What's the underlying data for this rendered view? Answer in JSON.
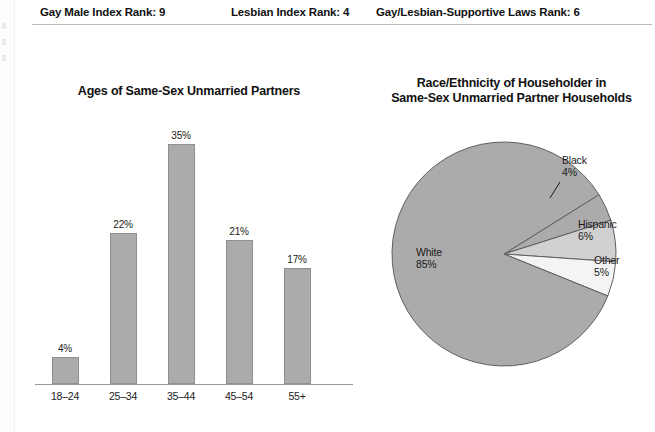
{
  "page": {
    "background_color": "#ffffff",
    "bleed_digits": [
      "4",
      "3",
      "3"
    ]
  },
  "header": {
    "ranks": [
      {
        "label": "Gay Male Index Rank: 9"
      },
      {
        "label": "Lesbian Index Rank: 4"
      },
      {
        "label": "Gay/Lesbian-Supportive Laws Rank: 6"
      }
    ]
  },
  "bar_panel": {
    "title": "Ages of Same-Sex Unmarried Partners"
  },
  "pie_panel": {
    "title_line1": "Race/Ethnicity of Householder in",
    "title_line2": "Same-Sex Unmarried Partner Households"
  },
  "chart_data": [
    {
      "type": "bar",
      "title": "Ages of Same-Sex Unmarried Partners",
      "xlabel": "",
      "ylabel": "",
      "ylim": [
        0,
        40
      ],
      "grid": false,
      "legend": "none",
      "categories": [
        "18–24",
        "25–34",
        "35–44",
        "45–54",
        "55+"
      ],
      "values": [
        4,
        22,
        35,
        21,
        17
      ],
      "value_labels": [
        "4%",
        "22%",
        "35%",
        "21%",
        "17%"
      ],
      "bar_color": "#ababab",
      "bar_edge_color": "#8f8f8f"
    },
    {
      "type": "pie",
      "title": "Race/Ethnicity of Householder in Same-Sex Unmarried Partner Households",
      "legend": "labels-on-slices",
      "labels": [
        "White",
        "Black",
        "Hispanic",
        "Other"
      ],
      "values": [
        85,
        4,
        6,
        5
      ],
      "value_labels": [
        "85%",
        "4%",
        "6%",
        "5%"
      ],
      "slice_colors": [
        "#ababab",
        "#ababab",
        "#d0d0d0",
        "#f4f4f4"
      ],
      "slice_edge_color": "#5f5f5f"
    }
  ]
}
